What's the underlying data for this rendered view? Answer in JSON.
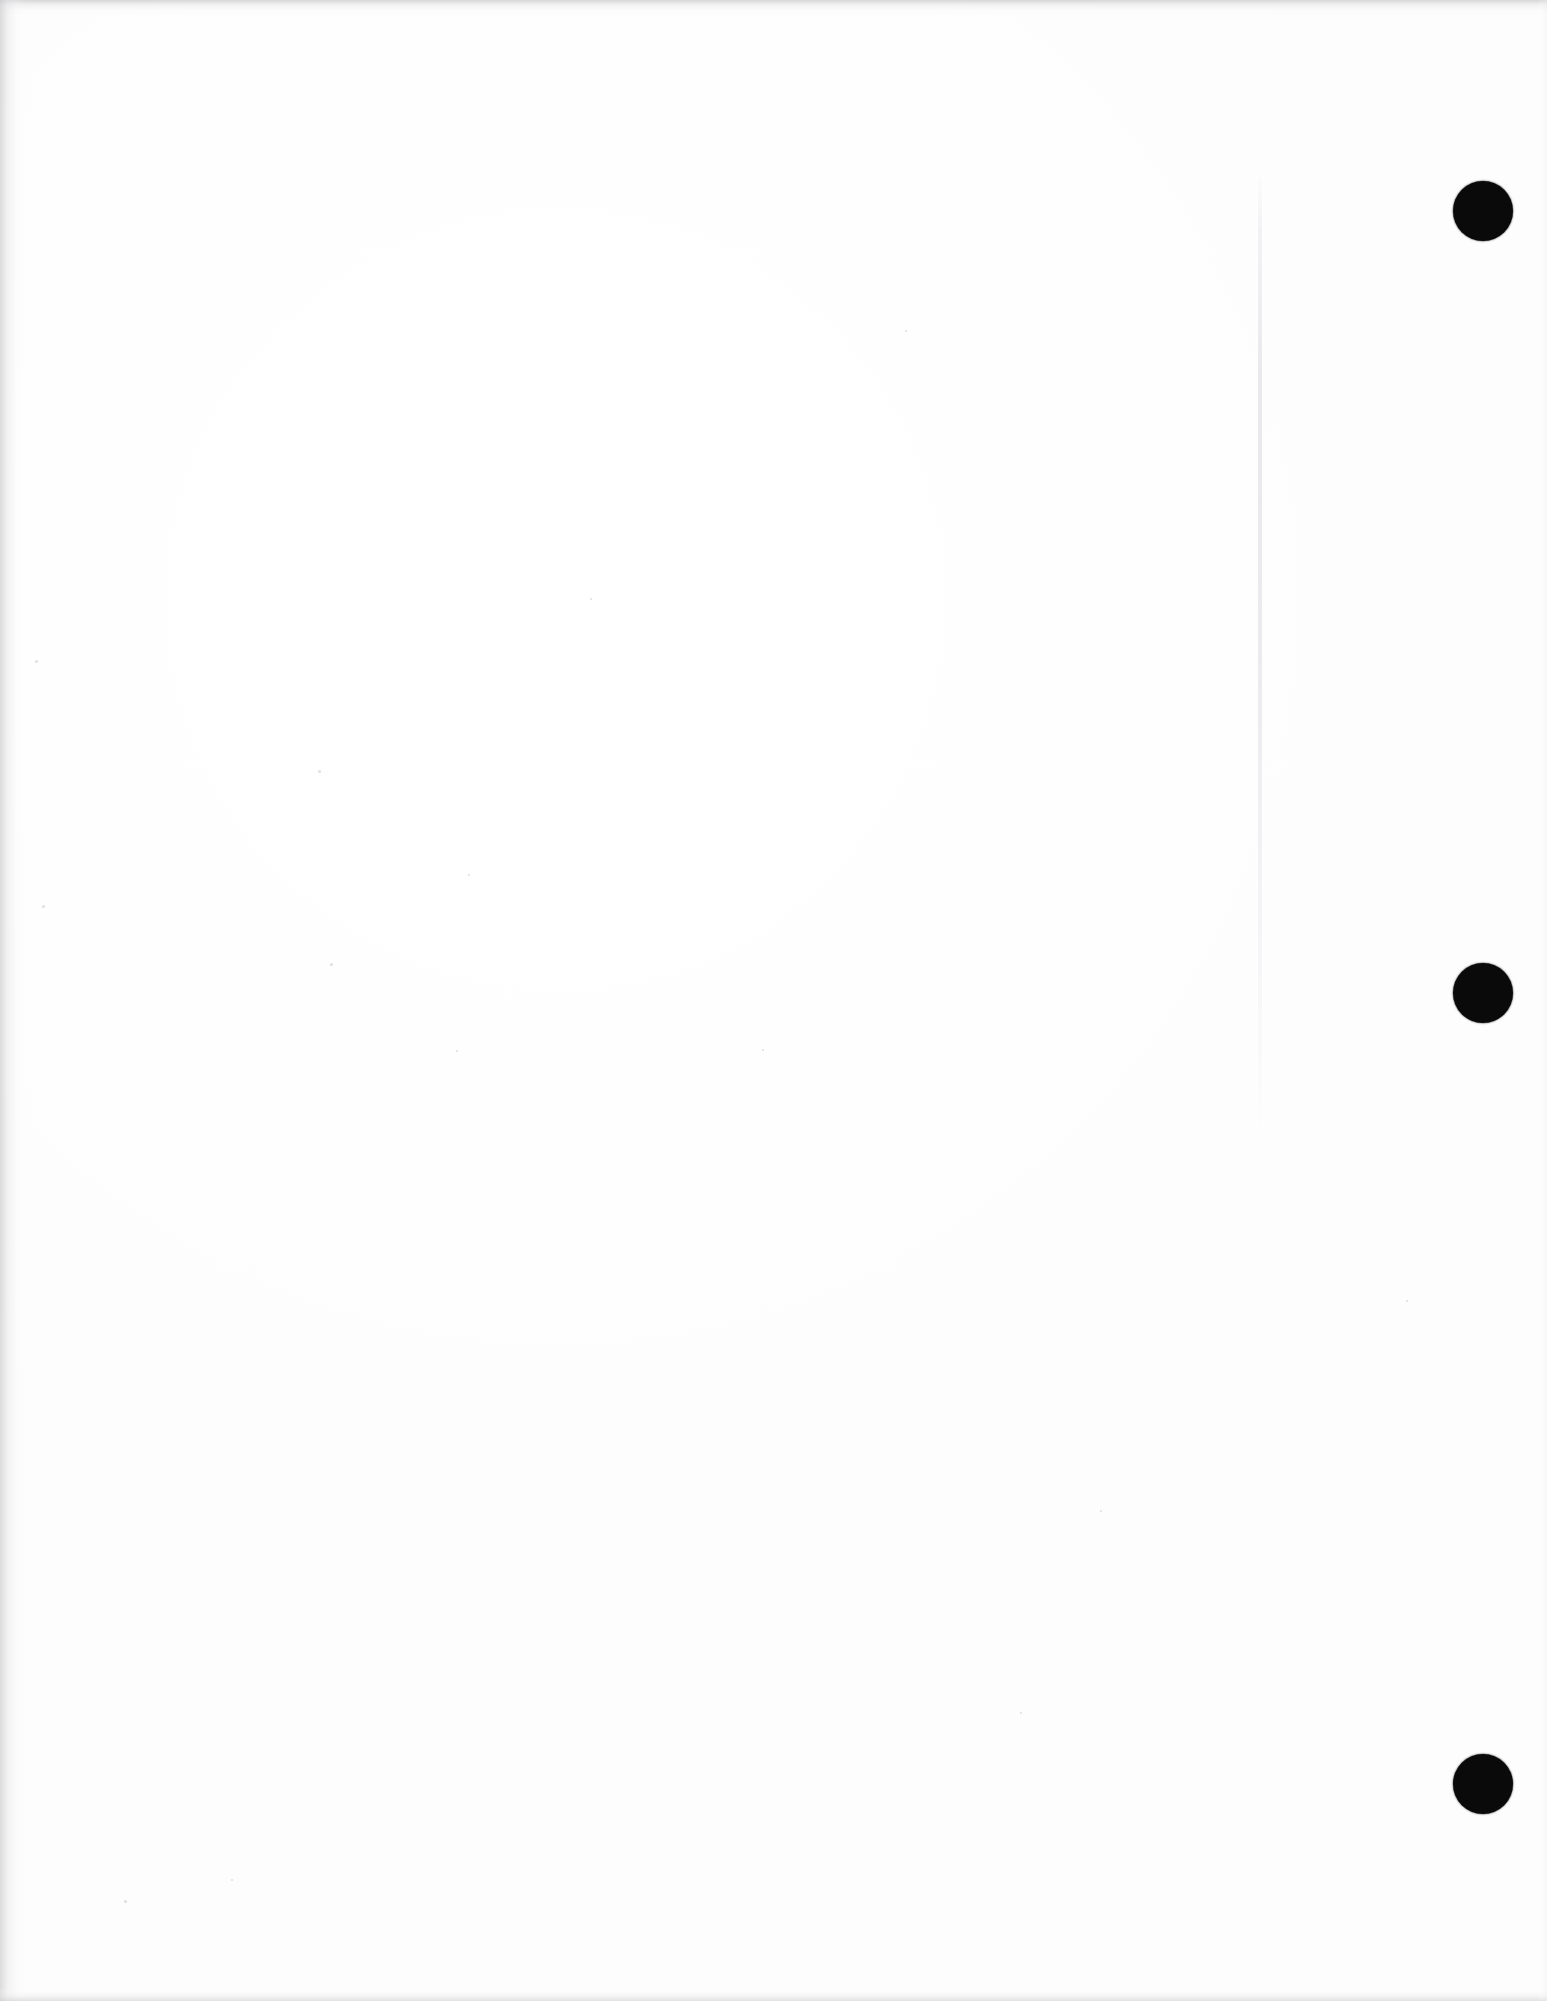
{
  "document": {
    "kind": "scanned-page-image",
    "page_label": "",
    "body_text": "",
    "width_px": 1547,
    "height_px": 2001
  },
  "colors": {
    "page_background": "#ffffff",
    "paper_tone": "#fdfdfd",
    "registration_mark": "#0a0a0a",
    "scan_edge_shadow": "#cdcdcf",
    "crease_line": "#e8e8ec"
  },
  "marks": {
    "label": "registration-marks",
    "count": 3,
    "shape": "circle",
    "diameter_px": 60,
    "items": [
      {
        "name": "registration-mark-top",
        "cx": 1483,
        "cy": 211,
        "d": 60
      },
      {
        "name": "registration-mark-middle",
        "cx": 1483,
        "cy": 993,
        "d": 60
      },
      {
        "name": "registration-mark-bottom",
        "cx": 1483,
        "cy": 1784,
        "d": 60
      }
    ]
  },
  "crease": {
    "name": "fold-crease-line",
    "x": 1260,
    "y_top": 172,
    "height": 965
  },
  "speckles": [
    {
      "x": 318,
      "y": 770,
      "s": 3
    },
    {
      "x": 468,
      "y": 874,
      "s": 2
    },
    {
      "x": 330,
      "y": 963,
      "s": 3
    },
    {
      "x": 456,
      "y": 1050,
      "s": 2
    },
    {
      "x": 762,
      "y": 1049,
      "s": 2
    },
    {
      "x": 590,
      "y": 598,
      "s": 2
    },
    {
      "x": 124,
      "y": 1900,
      "s": 3
    },
    {
      "x": 231,
      "y": 1879,
      "s": 2
    },
    {
      "x": 1100,
      "y": 1510,
      "s": 2
    },
    {
      "x": 905,
      "y": 330,
      "s": 2
    },
    {
      "x": 1406,
      "y": 1300,
      "s": 2
    },
    {
      "x": 35,
      "y": 660,
      "s": 3
    },
    {
      "x": 42,
      "y": 905,
      "s": 3
    },
    {
      "x": 1020,
      "y": 1712,
      "s": 2
    }
  ]
}
